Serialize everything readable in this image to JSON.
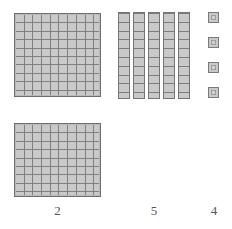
{
  "diagram": {
    "kind": "base-ten-blocks",
    "represented_number": "254",
    "background_color": "#ffffff",
    "block_fill_color": "#c9c9c9",
    "block_line_color": "#7f7f7f",
    "label_color": "#56565a",
    "columns": [
      {
        "place": "hundreds",
        "label": "2",
        "block_type": "hundred-flat",
        "block_count": 2,
        "cells_per_block": 100,
        "grid_rows": 10,
        "grid_cols": 10,
        "blocks": [
          {
            "x": 14,
            "y": 13,
            "w": 87,
            "h": 84
          },
          {
            "x": 14,
            "y": 123,
            "w": 87,
            "h": 74
          }
        ],
        "label_pos": {
          "x": 14,
          "y": 204,
          "w": 87
        }
      },
      {
        "place": "tens",
        "label": "5",
        "block_type": "ten-rod",
        "block_count": 5,
        "cells_per_block": 10,
        "grid_rows": 10,
        "grid_cols": 1,
        "blocks": [
          {
            "x": 118,
            "y": 12,
            "w": 12,
            "h": 87
          },
          {
            "x": 133,
            "y": 12,
            "w": 12,
            "h": 87
          },
          {
            "x": 148,
            "y": 12,
            "w": 12,
            "h": 87
          },
          {
            "x": 163,
            "y": 12,
            "w": 12,
            "h": 87
          },
          {
            "x": 178,
            "y": 12,
            "w": 12,
            "h": 87
          }
        ],
        "label_pos": {
          "x": 124,
          "y": 204,
          "w": 60
        }
      },
      {
        "place": "ones",
        "label": "4",
        "block_type": "unit-cube",
        "block_count": 4,
        "cells_per_block": 1,
        "grid_rows": 1,
        "grid_cols": 1,
        "blocks": [
          {
            "x": 208,
            "y": 12,
            "w": 11,
            "h": 11
          },
          {
            "x": 208,
            "y": 37,
            "w": 11,
            "h": 11
          },
          {
            "x": 208,
            "y": 62,
            "w": 11,
            "h": 11
          },
          {
            "x": 208,
            "y": 87,
            "w": 11,
            "h": 11
          }
        ],
        "label_pos": {
          "x": 198,
          "y": 204,
          "w": 32
        }
      }
    ]
  }
}
